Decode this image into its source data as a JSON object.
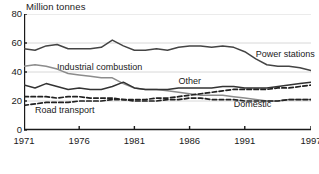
{
  "figure": {
    "ylabel": "Million tonnes",
    "caption": ""
  },
  "chart_data": {
    "type": "line",
    "title": "",
    "xlabel": "",
    "ylabel": "Million tonnes",
    "xlim": [
      1971,
      1997
    ],
    "ylim": [
      0,
      80
    ],
    "yticks": [
      0,
      20,
      40,
      60,
      80
    ],
    "xticks": [
      1971,
      1976,
      1981,
      1986,
      1991,
      1997
    ],
    "grid": true,
    "grid_axis": "y",
    "legend": "inline-annotations",
    "x": [
      1971,
      1972,
      1973,
      1974,
      1975,
      1976,
      1977,
      1978,
      1979,
      1980,
      1981,
      1982,
      1983,
      1984,
      1985,
      1986,
      1987,
      1988,
      1989,
      1990,
      1991,
      1992,
      1993,
      1994,
      1995,
      1996,
      1997
    ],
    "series": [
      {
        "name": "Power stations",
        "style": "solid",
        "color": "#444444",
        "values": [
          56,
          55,
          58,
          59,
          56,
          56,
          56,
          57,
          62,
          58,
          55,
          55,
          56,
          55,
          57,
          58,
          58,
          57,
          58,
          57,
          54,
          49,
          45,
          44,
          44,
          43,
          41
        ]
      },
      {
        "name": "Industrial combustion",
        "style": "solid",
        "color": "#8c8c8c",
        "values": [
          44,
          45,
          44,
          42,
          39,
          38,
          37,
          36,
          36,
          32,
          29,
          28,
          28,
          27,
          26,
          25,
          24,
          24,
          24,
          23,
          22,
          21,
          20,
          20,
          21,
          21,
          21
        ]
      },
      {
        "name": "Other",
        "style": "solid",
        "color": "#333333",
        "values": [
          31,
          29,
          32,
          30,
          28,
          29,
          28,
          28,
          30,
          33,
          29,
          28,
          28,
          28,
          29,
          29,
          29,
          29,
          30,
          30,
          29,
          29,
          29,
          30,
          31,
          32,
          33
        ]
      },
      {
        "name": "Domestic",
        "style": "dashed",
        "color": "#222222",
        "values": [
          23,
          23,
          23,
          22,
          23,
          23,
          22,
          22,
          22,
          21,
          20,
          20,
          20,
          21,
          21,
          22,
          22,
          21,
          21,
          21,
          20,
          20,
          20,
          20,
          21,
          21,
          21
        ]
      },
      {
        "name": "Road transport",
        "style": "dashed",
        "color": "#222222",
        "values": [
          17,
          18,
          19,
          19,
          19,
          20,
          20,
          20,
          21,
          21,
          21,
          21,
          22,
          22,
          23,
          24,
          25,
          26,
          27,
          28,
          28,
          28,
          28,
          29,
          29,
          30,
          31
        ]
      }
    ],
    "annotations": [
      {
        "text": "Power stations",
        "x": 1992,
        "y": 52
      },
      {
        "text": "Industrial combustion",
        "x": 1974,
        "y": 43
      },
      {
        "text": "Other",
        "x": 1985,
        "y": 33
      },
      {
        "text": "Domestic",
        "x": 1990,
        "y": 17
      },
      {
        "text": "Road transport",
        "x": 1972,
        "y": 13
      }
    ]
  }
}
